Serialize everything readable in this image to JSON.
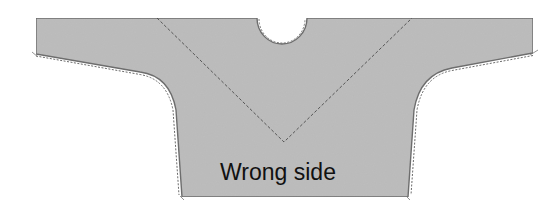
{
  "diagram": {
    "label": "Wrong side",
    "colors": {
      "fabric_fill": "#bdbdbd",
      "outline": "#6e6e6e",
      "stitch_line": "#4a4a4a",
      "label_text": "#111111",
      "background": "#ffffff"
    },
    "shape": {
      "description": "Flat garment pattern piece (kimono-sleeve top) with round neck notch and V-shaped dashed stitch line",
      "parts": [
        "left-sleeve",
        "right-sleeve",
        "body",
        "neck-opening",
        "v-stitch-line",
        "side-seams",
        "hem"
      ]
    }
  }
}
